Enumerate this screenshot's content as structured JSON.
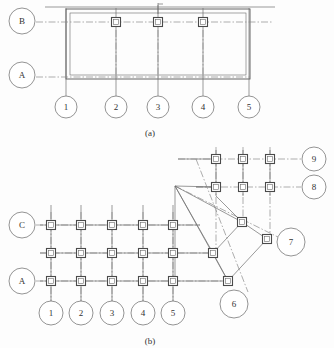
{
  "figures": [
    {
      "id": "figure-a",
      "caption": "(a)",
      "caption_pos": {
        "x": 150,
        "y": 133
      },
      "horizontal_grids": [
        {
          "label": "B",
          "bubble": {
            "cx": 22,
            "cy": 21,
            "r": 13
          },
          "axis_y": 22,
          "axis_x1": 36,
          "axis_x2": 272,
          "leader_x1": 35,
          "leader_x2": 66
        },
        {
          "label": "A",
          "bubble": {
            "cx": 22,
            "cy": 75,
            "r": 13
          },
          "axis_y": 77,
          "axis_x1": 36,
          "axis_x2": 250,
          "leader_x1": 35,
          "leader_x2": 66
        }
      ],
      "vertical_grids": [
        {
          "label": "1",
          "bubble": {
            "cx": 66,
            "cy": 107,
            "r": 11
          },
          "axis_x": 66,
          "axis_y1": 8,
          "axis_y2": 96
        },
        {
          "label": "2",
          "bubble": {
            "cx": 116,
            "cy": 107,
            "r": 11
          },
          "axis_x": 116,
          "axis_y1": 8,
          "axis_y2": 96
        },
        {
          "label": "3",
          "bubble": {
            "cx": 158,
            "cy": 107,
            "r": 11
          },
          "axis_x": 158,
          "axis_y1": 5,
          "axis_y2": 96
        },
        {
          "label": "4",
          "bubble": {
            "cx": 203,
            "cy": 107,
            "r": 11
          },
          "axis_x": 203,
          "axis_y1": 8,
          "axis_y2": 96
        },
        {
          "label": "5",
          "bubble": {
            "cx": 249,
            "cy": 107,
            "r": 11
          },
          "axis_x": 249,
          "axis_y1": 8,
          "axis_y2": 96
        }
      ],
      "columns": [
        {
          "cx": 116,
          "cy": 22
        },
        {
          "cx": 158,
          "cy": 22
        },
        {
          "cx": 203,
          "cy": 22
        }
      ],
      "walls": {
        "outer_rect": {
          "x": 66,
          "y": 9,
          "w": 184,
          "h": 70
        },
        "inner_rect": {
          "x": 70,
          "y": 13,
          "w": 176,
          "h": 62
        },
        "top_edge_line": {
          "x1": 45,
          "y1": 7,
          "x2": 275,
          "y2": 7
        }
      },
      "section_mark": {
        "x": 158,
        "y_top": 3,
        "y_bot": 14,
        "tick_x": 163
      }
    },
    {
      "id": "figure-b",
      "caption": "(b)",
      "caption_pos": {
        "x": 150,
        "y": 341
      },
      "horizontal_grids": [
        {
          "label": "9",
          "bubble": {
            "cx": 314,
            "cy": 159,
            "r": 12
          },
          "axis_y": 159,
          "axis_x1": 178,
          "axis_x2": 301
        },
        {
          "label": "8",
          "bubble": {
            "cx": 314,
            "cy": 187,
            "r": 12
          },
          "axis_y": 187,
          "axis_x1": 196,
          "axis_x2": 301
        },
        {
          "label": "C",
          "bubble": {
            "cx": 22,
            "cy": 225,
            "r": 13
          },
          "axis_y": 225,
          "axis_x1": 36,
          "axis_x2": 200
        },
        {
          "label": "",
          "bubble": null,
          "axis_y": 253,
          "axis_x1": 40,
          "axis_x2": 216
        },
        {
          "label": "A",
          "bubble": {
            "cx": 22,
            "cy": 281,
            "r": 13
          },
          "axis_y": 281,
          "axis_x1": 36,
          "axis_x2": 228
        }
      ],
      "vertical_grids": [
        {
          "label": "1",
          "bubble": {
            "cx": 51,
            "cy": 313,
            "r": 12
          },
          "axis_x": 51,
          "axis_y1": 205,
          "axis_y2": 301
        },
        {
          "label": "2",
          "bubble": {
            "cx": 81,
            "cy": 313,
            "r": 12
          },
          "axis_x": 81,
          "axis_y1": 205,
          "axis_y2": 301
        },
        {
          "label": "3",
          "bubble": {
            "cx": 112,
            "cy": 313,
            "r": 12
          },
          "axis_x": 112,
          "axis_y1": 205,
          "axis_y2": 301
        },
        {
          "label": "4",
          "bubble": {
            "cx": 143,
            "cy": 313,
            "r": 12
          },
          "axis_x": 143,
          "axis_y1": 205,
          "axis_y2": 301
        },
        {
          "label": "5",
          "bubble": {
            "cx": 173,
            "cy": 313,
            "r": 12
          },
          "axis_x": 173,
          "axis_y1": 205,
          "axis_y2": 301
        }
      ],
      "upper_vertical_axes": [
        {
          "x": 216,
          "y1": 147,
          "y2": 253
        },
        {
          "x": 243,
          "y1": 147,
          "y2": 222
        },
        {
          "x": 270,
          "y1": 147,
          "y2": 239
        }
      ],
      "columns": [
        {
          "cx": 216,
          "cy": 159
        },
        {
          "cx": 243,
          "cy": 159
        },
        {
          "cx": 270,
          "cy": 159
        },
        {
          "cx": 216,
          "cy": 187
        },
        {
          "cx": 243,
          "cy": 187
        },
        {
          "cx": 270,
          "cy": 187
        },
        {
          "cx": 51,
          "cy": 225
        },
        {
          "cx": 81,
          "cy": 225
        },
        {
          "cx": 112,
          "cy": 225
        },
        {
          "cx": 143,
          "cy": 225
        },
        {
          "cx": 173,
          "cy": 225
        },
        {
          "cx": 51,
          "cy": 253
        },
        {
          "cx": 81,
          "cy": 253
        },
        {
          "cx": 112,
          "cy": 253
        },
        {
          "cx": 143,
          "cy": 253
        },
        {
          "cx": 173,
          "cy": 253
        },
        {
          "cx": 51,
          "cy": 281
        },
        {
          "cx": 81,
          "cy": 281
        },
        {
          "cx": 112,
          "cy": 281
        },
        {
          "cx": 143,
          "cy": 281
        },
        {
          "cx": 173,
          "cy": 281
        },
        {
          "cx": 242,
          "cy": 222
        },
        {
          "cx": 213,
          "cy": 253
        },
        {
          "cx": 267,
          "cy": 239
        },
        {
          "cx": 228,
          "cy": 281
        }
      ],
      "angled_nodes": [
        {
          "label": "7",
          "bubble": {
            "cx": 291,
            "cy": 242,
            "r": 14
          },
          "node": {
            "cx": 267,
            "cy": 239
          }
        },
        {
          "label": "6",
          "bubble": {
            "cx": 234,
            "cy": 304,
            "r": 14
          },
          "node": {
            "cx": 228,
            "cy": 281
          }
        }
      ],
      "apex": {
        "x": 175,
        "y": 186
      },
      "brace_lines": [
        {
          "x1": 175,
          "y1": 186,
          "x2": 242,
          "y2": 222
        },
        {
          "x1": 175,
          "y1": 186,
          "x2": 213,
          "y2": 253
        },
        {
          "x1": 175,
          "y1": 186,
          "x2": 228,
          "y2": 281
        },
        {
          "x1": 175,
          "y1": 186,
          "x2": 175,
          "y2": 281
        },
        {
          "x1": 242,
          "y1": 222,
          "x2": 267,
          "y2": 239
        },
        {
          "x1": 267,
          "y1": 239,
          "x2": 228,
          "y2": 281
        },
        {
          "x1": 242,
          "y1": 222,
          "x2": 213,
          "y2": 253
        },
        {
          "x1": 213,
          "y1": 253,
          "x2": 228,
          "y2": 281
        },
        {
          "x1": 175,
          "y1": 186,
          "x2": 196,
          "y2": 187
        }
      ],
      "angled_axes": [
        {
          "x1": 175,
          "y1": 186,
          "x2": 290,
          "y2": 243
        },
        {
          "x1": 196,
          "y1": 159,
          "x2": 252,
          "y2": 290
        }
      ]
    }
  ]
}
